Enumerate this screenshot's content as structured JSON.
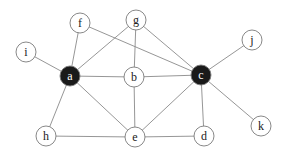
{
  "graph": {
    "node_radius": 10,
    "colors": {
      "edge": "#8a8a8a",
      "node_fill": "#ffffff",
      "node_stroke": "#7a7a7a",
      "highlight_fill": "#1a1a1a",
      "label": "#222222",
      "highlight_label": "#ffffff"
    },
    "nodes": [
      {
        "id": "a",
        "label": "a",
        "x": 70,
        "y": 76,
        "highlighted": true
      },
      {
        "id": "b",
        "label": "b",
        "x": 134,
        "y": 77,
        "highlighted": false
      },
      {
        "id": "c",
        "label": "c",
        "x": 201,
        "y": 75,
        "highlighted": true
      },
      {
        "id": "d",
        "label": "d",
        "x": 204,
        "y": 136,
        "highlighted": false
      },
      {
        "id": "e",
        "label": "e",
        "x": 135,
        "y": 137,
        "highlighted": false
      },
      {
        "id": "f",
        "label": "f",
        "x": 80,
        "y": 23,
        "highlighted": false
      },
      {
        "id": "g",
        "label": "g",
        "x": 136,
        "y": 20,
        "highlighted": false
      },
      {
        "id": "h",
        "label": "h",
        "x": 46,
        "y": 136,
        "highlighted": false
      },
      {
        "id": "i",
        "label": "i",
        "x": 26,
        "y": 52,
        "highlighted": false
      },
      {
        "id": "j",
        "label": "j",
        "x": 252,
        "y": 40,
        "highlighted": false
      },
      {
        "id": "k",
        "label": "k",
        "x": 261,
        "y": 126,
        "highlighted": false
      }
    ],
    "edges": [
      [
        "a",
        "i"
      ],
      [
        "a",
        "f"
      ],
      [
        "a",
        "g"
      ],
      [
        "a",
        "b"
      ],
      [
        "a",
        "h"
      ],
      [
        "a",
        "e"
      ],
      [
        "f",
        "c"
      ],
      [
        "g",
        "b"
      ],
      [
        "g",
        "c"
      ],
      [
        "b",
        "c"
      ],
      [
        "b",
        "e"
      ],
      [
        "c",
        "j"
      ],
      [
        "c",
        "e"
      ],
      [
        "c",
        "d"
      ],
      [
        "c",
        "k"
      ],
      [
        "h",
        "e"
      ],
      [
        "e",
        "d"
      ]
    ]
  }
}
